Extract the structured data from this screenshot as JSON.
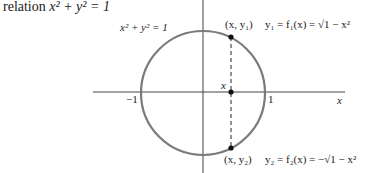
{
  "intro": {
    "prefix": "relation",
    "equation": "x² + y² = 1"
  },
  "figure": {
    "circle_label": "x² + y² = 1",
    "axis_x_label": "x",
    "tick_neg_one": "−1",
    "tick_one": "1",
    "point_x_label": "x",
    "upper_point_label": "(x, y₁)",
    "upper_function": "y₁ = f₁(x) = √1 − x²",
    "lower_point_label": "(x, y₂)",
    "lower_function": "y₂ = f₂(x) = −√1 − x²",
    "colors": {
      "circle": "#7a7a7a",
      "axes": "#444444",
      "points": "#111111"
    }
  }
}
